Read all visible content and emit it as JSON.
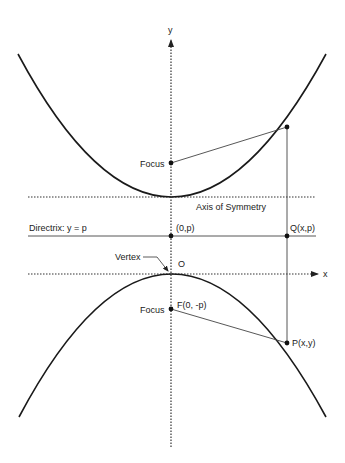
{
  "diagram": {
    "axes": {
      "x_label": "x",
      "y_label": "y",
      "origin_label": "O"
    },
    "labels": {
      "focus_upper": "Focus",
      "focus_lower": "Focus",
      "focus_lower_coords": "F(0, -p)",
      "axis_of_symmetry": "Axis of Symmetry",
      "directrix": "Directrix: y = p",
      "directrix_point": "(0,p)",
      "q_point": "Q(x,p)",
      "vertex": "Vertex",
      "p_point": "P(x,y)"
    },
    "colors": {
      "curve": "#1a1a1a",
      "line": "#444444",
      "axis": "#333333",
      "background": "#ffffff"
    }
  }
}
